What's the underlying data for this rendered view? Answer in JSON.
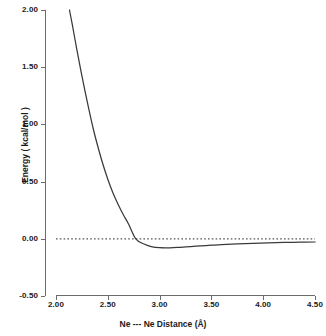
{
  "chart_data": {
    "type": "line",
    "title": "",
    "xlabel": "Ne --- Ne Distance (Å)",
    "ylabel": "Energy ( kcal/mol )",
    "xlim": [
      2.0,
      4.5
    ],
    "ylim": [
      -0.5,
      2.0
    ],
    "xticks": [
      "2.00",
      "2.50",
      "3.00",
      "3.50",
      "4.00",
      "4.50"
    ],
    "xtick_values": [
      2.0,
      2.5,
      3.0,
      3.5,
      4.0,
      4.5
    ],
    "yticks": [
      "2.00",
      "1.50",
      "1.00",
      "0.50",
      "0.00",
      "-0.50"
    ],
    "ytick_values": [
      2.0,
      1.5,
      1.0,
      0.5,
      0.0,
      -0.5
    ],
    "grid": false,
    "legend": false,
    "series": [
      {
        "name": "Ne-Ne potential energy curve",
        "color": "#3a3a3a",
        "style": "solid",
        "x": [
          2.13,
          2.16,
          2.2,
          2.24,
          2.28,
          2.32,
          2.36,
          2.4,
          2.45,
          2.5,
          2.55,
          2.6,
          2.65,
          2.7,
          2.77,
          2.85,
          2.92,
          3.0,
          3.1,
          3.2,
          3.3,
          3.4,
          3.5,
          3.6,
          3.75,
          3.9,
          4.05,
          4.2,
          4.35,
          4.5
        ],
        "y": [
          2.0,
          1.86,
          1.66,
          1.47,
          1.29,
          1.12,
          0.96,
          0.82,
          0.66,
          0.52,
          0.4,
          0.3,
          0.21,
          0.13,
          0.0,
          -0.046,
          -0.068,
          -0.078,
          -0.079,
          -0.074,
          -0.068,
          -0.062,
          -0.056,
          -0.051,
          -0.044,
          -0.039,
          -0.035,
          -0.032,
          -0.03,
          -0.028
        ]
      }
    ],
    "reference_line": {
      "name": "zero-energy-line",
      "orientation": "horizontal",
      "value": 0.0,
      "style": "dotted",
      "color": "#555555"
    },
    "annotations": {
      "well_minimum_energy": -0.079,
      "well_minimum_distance": 3.1,
      "zero_crossing_distance": 2.77
    }
  },
  "axes": {
    "line_color": "#6b6b6b"
  }
}
